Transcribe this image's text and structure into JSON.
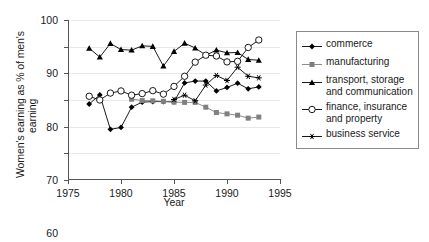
{
  "chart_data": {
    "type": "line",
    "title": "",
    "xlabel": "Year",
    "ylabel": "Women's earning as % of men's earning",
    "ylabel_lines": [
      "Women's earning as % of men's",
      "earning"
    ],
    "xlim": [
      1975,
      1995
    ],
    "ylim": [
      40,
      100
    ],
    "xticks": [
      1975,
      1980,
      1985,
      1990,
      1995
    ],
    "yticks": [
      40,
      50,
      60,
      70,
      80,
      90,
      100
    ],
    "xtick_labels": [
      "1975",
      "1980",
      "1985",
      "1990",
      "1995"
    ],
    "ytick_labels": [
      "40",
      "50",
      "60",
      "70",
      "80",
      "90",
      "100"
    ],
    "grid": "horizontal",
    "legend_position": "right",
    "series": [
      {
        "name": "commerce",
        "marker": "filled-diamond",
        "color": "#000000",
        "x": [
          1977,
          1978,
          1979,
          1980,
          1981,
          1982,
          1983,
          1984,
          1985,
          1986,
          1987,
          1988,
          1989,
          1990,
          1991,
          1992,
          1993
        ],
        "values": [
          68.5,
          71.9,
          59.0,
          59.7,
          67.3,
          69.2,
          69.4,
          69.4,
          69.3,
          76.4,
          77.1,
          77.1,
          73.4,
          74.7,
          76.3,
          74.2,
          74.9
        ]
      },
      {
        "name": "manufacturing",
        "marker": "filled-square",
        "color": "#808080",
        "x": [
          1981,
          1982,
          1983,
          1984,
          1985,
          1986,
          1987,
          1988,
          1989,
          1990,
          1991,
          1992,
          1993
        ],
        "values": [
          70.3,
          69.8,
          69.7,
          69.5,
          69.2,
          69.1,
          69.1,
          67.3,
          65.3,
          64.8,
          64.3,
          63.2,
          63.6
        ]
      },
      {
        "name": "transport, storage and communication",
        "marker": "filled-triangle",
        "color": "#000000",
        "x": [
          1977,
          1978,
          1979,
          1980,
          1981,
          1982,
          1983,
          1984,
          1985,
          1986,
          1987,
          1988,
          1989,
          1990,
          1991,
          1992,
          1993
        ],
        "values": [
          89.4,
          86.1,
          91.2,
          88.9,
          88.7,
          90.3,
          90.1,
          82.7,
          88.2,
          91.3,
          89.5,
          86.8,
          88.7,
          87.7,
          87.8,
          85.2,
          84.9
        ]
      },
      {
        "name": "finance, insurance and property",
        "marker": "open-circle",
        "color": "#000000",
        "x": [
          1977,
          1978,
          1979,
          1980,
          1981,
          1982,
          1983,
          1984,
          1985,
          1986,
          1987,
          1988,
          1989,
          1990,
          1991,
          1992,
          1993
        ],
        "values": [
          71.4,
          70.0,
          72.6,
          73.4,
          71.8,
          72.4,
          73.5,
          72.2,
          75.1,
          78.9,
          84.2,
          86.8,
          86.5,
          84.3,
          84.5,
          89.7,
          92.5
        ]
      },
      {
        "name": "business service",
        "marker": "asterisk",
        "color": "#000000",
        "x": [
          1985,
          1986,
          1987,
          1988,
          1989,
          1990,
          1991,
          1992,
          1993
        ],
        "values": [
          70.2,
          71.8,
          69.7,
          75.6,
          79.2,
          77.3,
          82.3,
          78.9,
          78.3
        ]
      }
    ]
  },
  "legend": {
    "items": [
      {
        "label": "commerce",
        "marker": "filled-diamond"
      },
      {
        "label": "manufacturing",
        "marker": "filled-square"
      },
      {
        "label": "transport, storage and communication",
        "marker": "filled-triangle"
      },
      {
        "label": "finance, insurance and property",
        "marker": "open-circle"
      },
      {
        "label": "business service",
        "marker": "asterisk"
      }
    ]
  }
}
